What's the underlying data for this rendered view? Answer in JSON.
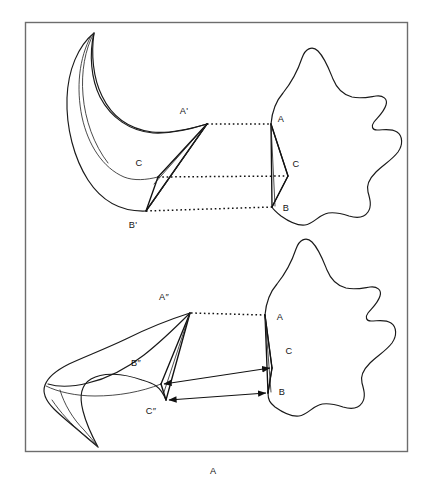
{
  "figure": {
    "caption": "A",
    "frame": {
      "x": 25,
      "y": 22,
      "width": 383,
      "height": 430,
      "stroke": "#6d6d6d"
    },
    "ink_color": "#111111",
    "background": "#ffffff"
  },
  "panels": [
    {
      "id": "upper-panel",
      "name": "upper-correspondence-diagram",
      "correspondence_style": "dotted-lines",
      "source_shape": {
        "name": "star-blob-upper",
        "label_set": [
          "A",
          "C",
          "B"
        ]
      },
      "target_shape": {
        "name": "crescent-upper",
        "label_set": [
          "A'",
          "C",
          "B'"
        ]
      },
      "labels": [
        {
          "text": "A'",
          "x": 184,
          "y": 114,
          "name": "label-a-prime"
        },
        {
          "text": "C",
          "x": 139,
          "y": 166,
          "name": "label-c-prime"
        },
        {
          "text": "B'",
          "x": 133,
          "y": 228,
          "name": "label-b-prime"
        },
        {
          "text": "A",
          "x": 281,
          "y": 122,
          "name": "label-a"
        },
        {
          "text": "C",
          "x": 295,
          "y": 167,
          "name": "label-c"
        },
        {
          "text": "B",
          "x": 285,
          "y": 211,
          "name": "label-b"
        }
      ],
      "correspondences": [
        {
          "from": [
            207,
            124
          ],
          "to": [
            271,
            124
          ],
          "name": "corr-a"
        },
        {
          "from": [
            158,
            177
          ],
          "to": [
            288,
            176
          ],
          "name": "corr-c"
        },
        {
          "from": [
            146,
            211
          ],
          "to": [
            272,
            207
          ],
          "name": "corr-b"
        }
      ]
    },
    {
      "id": "lower-panel",
      "name": "lower-correspondence-diagram",
      "correspondence_style": "double-headed-arrows",
      "source_shape": {
        "name": "star-blob-lower",
        "label_set": [
          "A",
          "C",
          "B"
        ]
      },
      "target_shape": {
        "name": "crescent-lower",
        "label_set": [
          "A″",
          "B″",
          "C″"
        ]
      },
      "labels": [
        {
          "text": "A″",
          "x": 164,
          "y": 300,
          "name": "label-a-double-prime"
        },
        {
          "text": "B″",
          "x": 136,
          "y": 366,
          "name": "label-b-double-prime"
        },
        {
          "text": "C″",
          "x": 151,
          "y": 414,
          "name": "label-c-double-prime"
        },
        {
          "text": "A",
          "x": 279,
          "y": 320,
          "name": "label-a-lower"
        },
        {
          "text": "C",
          "x": 288,
          "y": 354,
          "name": "label-c-lower"
        },
        {
          "text": "B",
          "x": 281,
          "y": 395,
          "name": "label-b-lower"
        }
      ],
      "correspondences": [
        {
          "from": [
            190,
            313
          ],
          "to": [
            265,
            315
          ],
          "name": "corr-a-lower",
          "style": "dotted"
        },
        {
          "from": [
            161,
            384
          ],
          "to": [
            272,
            368
          ],
          "name": "corr-c-lower",
          "style": "double-arrow"
        },
        {
          "from": [
            166,
            400
          ],
          "to": [
            268,
            393
          ],
          "name": "corr-b-lower",
          "style": "double-arrow"
        }
      ]
    }
  ]
}
